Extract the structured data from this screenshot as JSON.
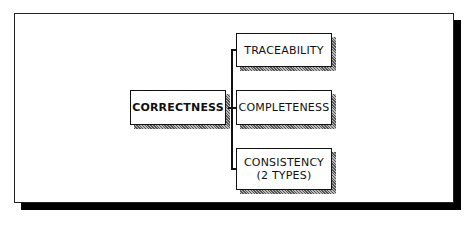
{
  "diagram": {
    "root": {
      "label": "CORRECTNESS"
    },
    "children": [
      {
        "label": "TRACEABILITY"
      },
      {
        "label": "COMPLETENESS"
      },
      {
        "label": "CONSISTENCY",
        "sublabel": "(2 TYPES)"
      }
    ]
  }
}
